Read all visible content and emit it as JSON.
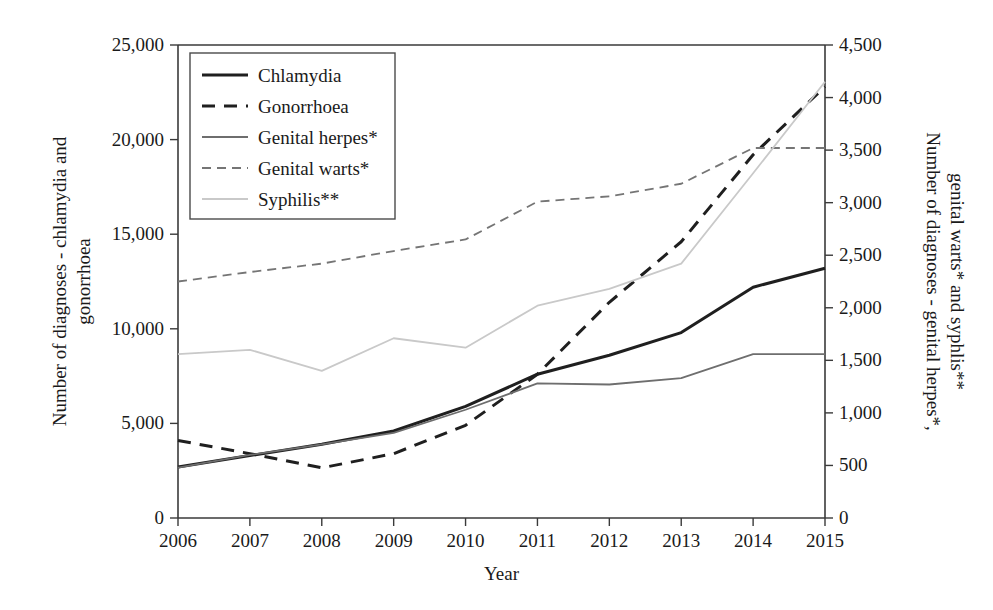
{
  "chart_data": {
    "type": "line",
    "title": "",
    "xlabel": "Year",
    "ylabel": "Number of diagnoses - chlamydia and gonorrhoea",
    "ylabel_right": "Number of diagnoses - genital herpes*, genital warts* and syphlis**",
    "x": [
      2006,
      2007,
      2008,
      2009,
      2010,
      2011,
      2012,
      2013,
      2014,
      2015
    ],
    "xticklabels": [
      "2006",
      "2007",
      "2008",
      "2009",
      "2010",
      "2011",
      "2012",
      "2013",
      "2014",
      "2015"
    ],
    "ylim": [
      0,
      25000
    ],
    "yticks": [
      0,
      5000,
      10000,
      15000,
      20000,
      25000
    ],
    "yticklabels": [
      "0",
      "5,000",
      "10,000",
      "15,000",
      "20,000",
      "25,000"
    ],
    "ylim_right": [
      0,
      4500
    ],
    "yticks_right": [
      0,
      500,
      1000,
      1500,
      2000,
      2500,
      3000,
      3500,
      4000,
      4500
    ],
    "yticklabels_right": [
      "0",
      "500",
      "1,000",
      "1,500",
      "2,000",
      "2,500",
      "3,000",
      "3,500",
      "4,000",
      "4,500"
    ],
    "grid": false,
    "legend_position": "upper-left-inside",
    "series": [
      {
        "name": "Chlamydia",
        "axis": "left",
        "style": "solid",
        "color": "#1f1f1f",
        "width": 3.0,
        "values": [
          2700,
          3300,
          3900,
          4600,
          5900,
          7600,
          8600,
          9800,
          12200,
          13200
        ]
      },
      {
        "name": "Gonorrhoea",
        "axis": "left",
        "style": "dashed",
        "color": "#1f1f1f",
        "width": 3.0,
        "values": [
          4100,
          3400,
          2650,
          3400,
          4900,
          7600,
          11400,
          14600,
          19200,
          22800
        ]
      },
      {
        "name": "Genital herpes*",
        "axis": "right",
        "style": "solid",
        "color": "#6e6e6e",
        "width": 1.8,
        "values": [
          480,
          600,
          700,
          810,
          1030,
          1280,
          1270,
          1330,
          1560,
          1560
        ]
      },
      {
        "name": "Genital warts*",
        "axis": "right",
        "style": "dashed",
        "color": "#757575",
        "width": 1.8,
        "values": [
          2250,
          2340,
          2420,
          2540,
          2650,
          3010,
          3060,
          3180,
          3520,
          3520
        ]
      },
      {
        "name": "Syphilis**",
        "axis": "right",
        "style": "solid",
        "color": "#c9c9c9",
        "width": 1.8,
        "values": [
          1560,
          1600,
          1400,
          1710,
          1620,
          2020,
          2180,
          2420,
          3280,
          4150
        ]
      }
    ]
  },
  "legend": {
    "items": [
      {
        "label": "Chlamydia"
      },
      {
        "label": "Gonorrhoea"
      },
      {
        "label": "Genital herpes*"
      },
      {
        "label": "Genital warts*"
      },
      {
        "label": "Syphilis**"
      }
    ]
  },
  "axes": {
    "x_title": "Year",
    "y_left_title_line1": "Number of diagnoses - chlamydia and",
    "y_left_title_line2": "gonorrhoea",
    "y_right_title_line1": "Number of diagnoses - genital herpes*,",
    "y_right_title_line2": "genital warts* and syphlis**"
  }
}
